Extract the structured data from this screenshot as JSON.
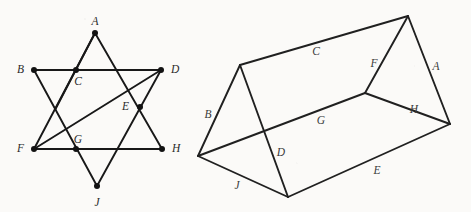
{
  "page": {
    "background_color": "#fbfaf8",
    "ink_color": "#181818",
    "width": 471,
    "height": 212
  },
  "star_figure": {
    "name": "hexagram-star",
    "vertices": [
      {
        "id": "A",
        "label": "A",
        "x": 95,
        "y": 33,
        "label_x": 95,
        "label_y": 22,
        "anchor": "middle"
      },
      {
        "id": "B",
        "label": "B",
        "x": 34,
        "y": 70,
        "label_x": 24,
        "label_y": 70,
        "anchor": "end"
      },
      {
        "id": "C",
        "label": "C",
        "x": 76,
        "y": 70,
        "label_x": 78,
        "label_y": 82,
        "anchor": "middle"
      },
      {
        "id": "D",
        "label": "D",
        "x": 161,
        "y": 70,
        "label_x": 171,
        "label_y": 70,
        "anchor": "start"
      },
      {
        "id": "E",
        "label": "E",
        "x": 140,
        "y": 107,
        "label_x": 129,
        "label_y": 107,
        "anchor": "end"
      },
      {
        "id": "F",
        "label": "F",
        "x": 34,
        "y": 149,
        "label_x": 24,
        "label_y": 149,
        "anchor": "end"
      },
      {
        "id": "G",
        "label": "G",
        "x": 76,
        "y": 149,
        "label_x": 78,
        "label_y": 140,
        "anchor": "middle"
      },
      {
        "id": "H",
        "label": "H",
        "x": 162,
        "y": 149,
        "label_x": 172,
        "label_y": 149,
        "anchor": "start"
      },
      {
        "id": "J",
        "label": "J",
        "x": 97,
        "y": 186,
        "label_x": 97,
        "label_y": 203,
        "anchor": "middle"
      }
    ],
    "edges": [
      {
        "from": "B",
        "to": "D",
        "x1": 34,
        "y1": 70,
        "x2": 161,
        "y2": 70
      },
      {
        "from": "F",
        "to": "H",
        "x1": 34,
        "y1": 149,
        "x2": 162,
        "y2": 149
      },
      {
        "from": "A",
        "to": "B",
        "x1": 95,
        "y1": 33,
        "x2": 55,
        "y2": 110
      },
      {
        "from": "A",
        "to": "H",
        "x1": 95,
        "y1": 33,
        "x2": 162,
        "y2": 149
      },
      {
        "from": "B",
        "to": "J",
        "x1": 34,
        "y1": 70,
        "x2": 97,
        "y2": 186
      },
      {
        "from": "D",
        "to": "J",
        "x1": 161,
        "y1": 70,
        "x2": 97,
        "y2": 186
      },
      {
        "from": "D",
        "to": "F",
        "x1": 161,
        "y1": 70,
        "x2": 34,
        "y2": 149
      },
      {
        "from": "A",
        "to": "F",
        "x1": 95,
        "y1": 33,
        "x2": 34,
        "y2": 149
      }
    ]
  },
  "prism_figure": {
    "name": "triangular-prism",
    "vertices": [
      {
        "id": "back_left_apex",
        "x": 240,
        "y": 65
      },
      {
        "id": "back_right_apex",
        "x": 408,
        "y": 16
      },
      {
        "id": "left_bottom_back",
        "x": 198,
        "y": 156
      },
      {
        "id": "front_bottom",
        "x": 288,
        "y": 197
      },
      {
        "id": "inner_junction",
        "x": 365,
        "y": 93
      },
      {
        "id": "right_bottom",
        "x": 450,
        "y": 124
      }
    ],
    "edges": [
      {
        "label": "C",
        "x1": 240,
        "y1": 65,
        "x2": 408,
        "y2": 16,
        "label_x": 316,
        "label_y": 52,
        "style": "solid"
      },
      {
        "label": "A",
        "x1": 408,
        "y1": 16,
        "x2": 450,
        "y2": 124,
        "label_x": 436,
        "label_y": 67,
        "style": "solid"
      },
      {
        "label": "B",
        "x1": 240,
        "y1": 65,
        "x2": 198,
        "y2": 156,
        "label_x": 208,
        "label_y": 115,
        "style": "solid"
      },
      {
        "label": "F",
        "x1": 408,
        "y1": 16,
        "x2": 365,
        "y2": 93,
        "label_x": 374,
        "label_y": 64,
        "style": "solid"
      },
      {
        "label": "H",
        "x1": 365,
        "y1": 93,
        "x2": 450,
        "y2": 124,
        "label_x": 414,
        "label_y": 110,
        "style": "solid"
      },
      {
        "label": "G",
        "x1": 198,
        "y1": 156,
        "x2": 365,
        "y2": 93,
        "label_x": 321,
        "label_y": 121,
        "style": "solid"
      },
      {
        "label": "D",
        "x1": 240,
        "y1": 65,
        "x2": 288,
        "y2": 197,
        "label_x": 281,
        "label_y": 153,
        "style": "solid"
      },
      {
        "label": "J",
        "x1": 198,
        "y1": 156,
        "x2": 288,
        "y2": 197,
        "label_x": 237,
        "label_y": 186,
        "style": "solid"
      },
      {
        "label": "E",
        "x1": 288,
        "y1": 197,
        "x2": 450,
        "y2": 124,
        "label_x": 377,
        "label_y": 171,
        "style": "solid"
      }
    ],
    "labels": [
      "A",
      "B",
      "C",
      "D",
      "E",
      "F",
      "G",
      "H",
      "J"
    ]
  }
}
